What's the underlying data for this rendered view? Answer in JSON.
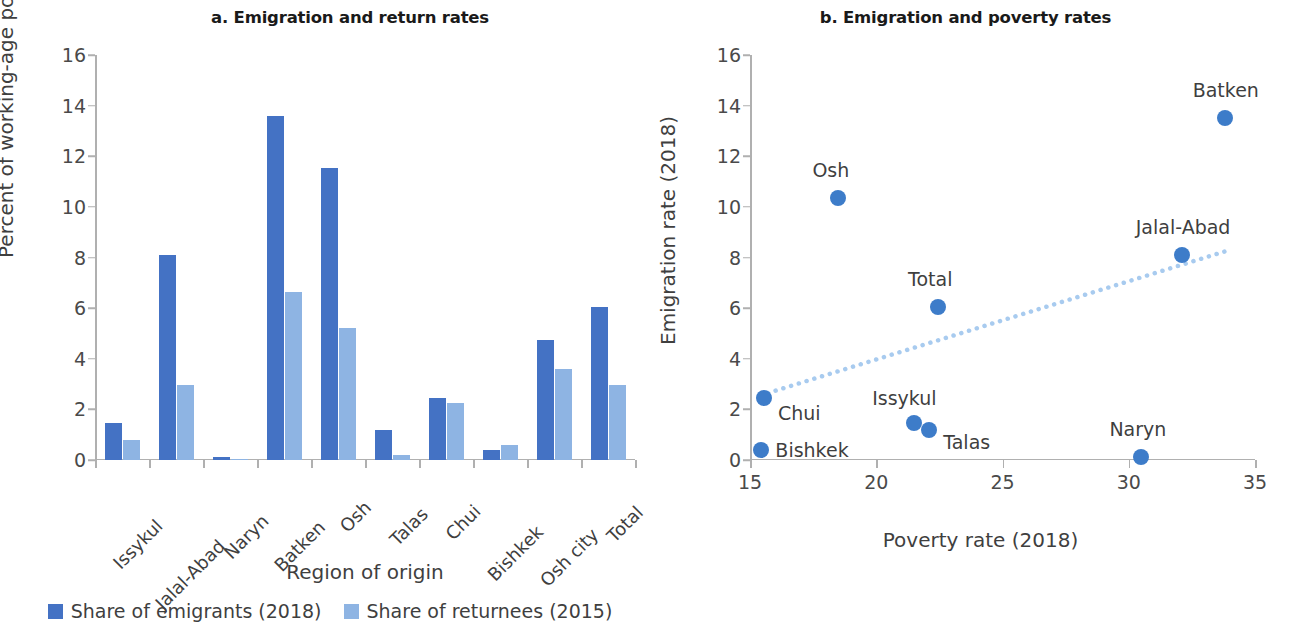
{
  "panel_a": {
    "title": "a. Emigration and return rates",
    "ylabel": "Percent of working-age population",
    "xlabel": "Region of origin"
  },
  "panel_b": {
    "title": "b. Emigration and poverty rates",
    "ylabel": "Emigration rate (2018)",
    "xlabel": "Poverty rate (2018)"
  },
  "legend": {
    "items": [
      {
        "label": "Share of emigrants (2018)",
        "color": "#4472c4"
      },
      {
        "label": "Share of returnees (2015)",
        "color": "#8eb4e3"
      }
    ]
  },
  "chart_data": [
    {
      "type": "bar",
      "title": "a. Emigration and return rates",
      "xlabel": "Region of origin",
      "ylabel": "Percent of working-age population",
      "ylim": [
        0,
        16
      ],
      "yticks": [
        0,
        2,
        4,
        6,
        8,
        10,
        12,
        14,
        16
      ],
      "grid": false,
      "legend_position": "bottom",
      "categories": [
        "Issykul",
        "Jalal-Abad",
        "Naryn",
        "Batken",
        "Osh",
        "Talas",
        "Chui",
        "Bishkek",
        "Osh city",
        "Total"
      ],
      "series": [
        {
          "name": "Share of emigrants (2018)",
          "color": "#4472c4",
          "values": [
            1.45,
            8.1,
            0.1,
            13.6,
            11.55,
            1.2,
            2.45,
            0.4,
            4.75,
            6.05
          ]
        },
        {
          "name": "Share of returnees (2015)",
          "color": "#8eb4e3",
          "values": [
            0.8,
            2.95,
            0.05,
            6.65,
            5.2,
            0.2,
            2.25,
            0.6,
            3.6,
            2.95
          ]
        }
      ]
    },
    {
      "type": "scatter",
      "title": "b. Emigration and poverty rates",
      "xlabel": "Poverty rate (2018)",
      "ylabel": "Emigration rate (2018)",
      "xlim": [
        15,
        35
      ],
      "ylim": [
        0,
        16
      ],
      "xticks": [
        15,
        20,
        25,
        30,
        35
      ],
      "yticks": [
        0,
        2,
        4,
        6,
        8,
        10,
        12,
        14,
        16
      ],
      "grid": false,
      "point_color": "#3d7cc9",
      "trendline": {
        "style": "dotted",
        "color": "#a8cbef",
        "x0": 15.4,
        "y0": 2.55,
        "x1": 34.0,
        "y1": 8.3
      },
      "points": [
        {
          "label": "Bishkek",
          "x": 15.45,
          "y": 0.4,
          "label_dx": 14,
          "label_dy": -11
        },
        {
          "label": "Chui",
          "x": 15.55,
          "y": 2.45,
          "label_dx": 14,
          "label_dy": 4
        },
        {
          "label": "Osh",
          "x": 18.5,
          "y": 10.35,
          "label_dx": -26,
          "label_dy": -39
        },
        {
          "label": "Issykul",
          "x": 21.5,
          "y": 1.45,
          "label_dx": -42,
          "label_dy": -36
        },
        {
          "label": "Talas",
          "x": 22.1,
          "y": 1.2,
          "label_dx": 14,
          "label_dy": 1
        },
        {
          "label": "Total",
          "x": 22.45,
          "y": 6.05,
          "label_dx": -30,
          "label_dy": -39
        },
        {
          "label": "Naryn",
          "x": 30.5,
          "y": 0.1,
          "label_dx": -32,
          "label_dy": -39
        },
        {
          "label": "Jalal-Abad",
          "x": 32.1,
          "y": 8.1,
          "label_dx": -46,
          "label_dy": -39
        },
        {
          "label": "Batken",
          "x": 33.8,
          "y": 13.5,
          "label_dx": -32,
          "label_dy": -39
        }
      ]
    }
  ]
}
